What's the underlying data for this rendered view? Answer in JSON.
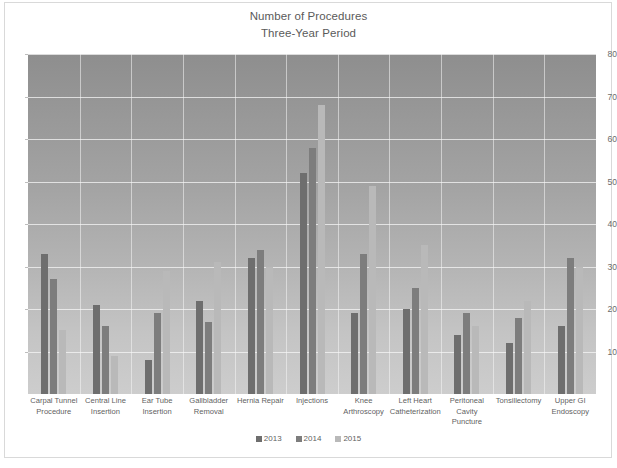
{
  "chart_data": {
    "type": "bar",
    "title": "Number of Procedures",
    "subtitle": "Three-Year Period",
    "xlabel": "",
    "ylabel": "",
    "ylim": [
      0,
      80
    ],
    "ytick_step": 10,
    "yticks": [
      "80",
      "70",
      "60",
      "50",
      "40",
      "30",
      "20",
      "10"
    ],
    "grid": true,
    "legend_position": "bottom",
    "categories": [
      "Carpal Tunnel Procedure",
      "Central Line Insertion",
      "Ear Tube Insertion",
      "Gallbladder Removal",
      "Hernia Repair",
      "Injections",
      "Knee Arthroscopy",
      "Left Heart Catheterization",
      "Peritoneal Cavity Puncture",
      "Tonsillectomy",
      "Upper GI Endoscopy"
    ],
    "category_lines": [
      [
        "Carpal Tunnel",
        "Procedure"
      ],
      [
        "Central Line",
        "Insertion"
      ],
      [
        "Ear Tube",
        "Insertion"
      ],
      [
        "Gallbladder",
        "Removal"
      ],
      [
        "Hernia Repair"
      ],
      [
        "Injections"
      ],
      [
        "Knee",
        "Arthroscopy"
      ],
      [
        "Left Heart",
        "Catheterization"
      ],
      [
        "Peritoneal",
        "Cavity Puncture"
      ],
      [
        "Tonsillectomy"
      ],
      [
        "Upper GI",
        "Endoscopy"
      ]
    ],
    "series": [
      {
        "name": "2013",
        "color": "#6e6e6e",
        "values": [
          33,
          21,
          8,
          22,
          32,
          52,
          19,
          20,
          14,
          12,
          16
        ]
      },
      {
        "name": "2014",
        "color": "#7d7d7d",
        "values": [
          27,
          16,
          19,
          17,
          34,
          58,
          33,
          25,
          19,
          18,
          32
        ]
      },
      {
        "name": "2015",
        "color": "#b9b9b9",
        "values": [
          15,
          9,
          29,
          31,
          30,
          68,
          49,
          35,
          16,
          22,
          30
        ]
      }
    ]
  }
}
